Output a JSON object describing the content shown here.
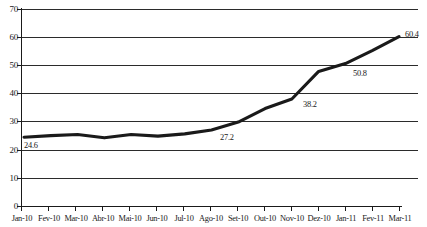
{
  "chart_data": {
    "type": "line",
    "title": "",
    "xlabel": "",
    "ylabel": "",
    "categories": [
      "Jan-10",
      "Fev-10",
      "Mar-10",
      "Abr-10",
      "Mai-10",
      "Jun-10",
      "Jul-10",
      "Ago-10",
      "Set-10",
      "Out-10",
      "Nov-10",
      "Dez-10",
      "Jan-11",
      "Fev-11",
      "Mar-11"
    ],
    "values": [
      24.6,
      25.2,
      25.6,
      24.4,
      25.6,
      25.0,
      25.8,
      27.2,
      30.0,
      34.8,
      38.2,
      48.0,
      50.8,
      55.4,
      60.4
    ],
    "series": [
      {
        "name": "series-1",
        "values": [
          24.6,
          25.2,
          25.6,
          24.4,
          25.6,
          25.0,
          25.8,
          27.2,
          30.0,
          34.8,
          38.2,
          48.0,
          50.8,
          55.4,
          60.4
        ]
      }
    ],
    "point_labels": [
      {
        "category": "Jan-10",
        "value": 24.6,
        "text": "24.6"
      },
      {
        "category": "Ago-10",
        "value": 27.2,
        "text": "27.2"
      },
      {
        "category": "Nov-10",
        "value": 38.2,
        "text": "38.2"
      },
      {
        "category": "Jan-11",
        "value": 50.8,
        "text": "50.8"
      },
      {
        "category": "Mar-11",
        "value": 60.4,
        "text": "60.4"
      }
    ],
    "yticks": [
      "0",
      "10",
      "20",
      "30",
      "40",
      "50",
      "60",
      "70"
    ],
    "ylim": [
      0,
      70
    ],
    "grid": true,
    "grid_axis": "y",
    "legend": false,
    "legend_position": "none",
    "line_color": "#1a1a1a",
    "grid_color": "#333333",
    "axis_color": "#1a1a1a",
    "background": "#ffffff"
  }
}
